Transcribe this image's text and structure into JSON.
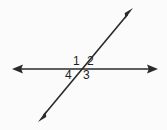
{
  "figure": {
    "kind": "geometry-diagram",
    "background_color": "#fbfbfb",
    "line_color": "#2a2a2a",
    "label_color": "#1d1d1d",
    "lines": [
      {
        "name": "horizontal-line",
        "x1": 13,
        "y1": 69,
        "x2": 157,
        "y2": 69,
        "arrow_start": true,
        "arrow_end": true
      },
      {
        "name": "transversal-line",
        "x1": 39,
        "y1": 121,
        "x2": 132,
        "y2": 9,
        "arrow_start": true,
        "arrow_end": true
      }
    ],
    "intersection": {
      "x": 82,
      "y": 69
    },
    "angle_labels": [
      {
        "id": "1",
        "text": "1",
        "position": "upper-left",
        "x": 77,
        "y": 61
      },
      {
        "id": "2",
        "text": "2",
        "position": "upper-right",
        "x": 91,
        "y": 61
      },
      {
        "id": "3",
        "text": "3",
        "position": "lower-right",
        "x": 87,
        "y": 75
      },
      {
        "id": "4",
        "text": "4",
        "position": "lower-left",
        "x": 69,
        "y": 75
      }
    ]
  }
}
